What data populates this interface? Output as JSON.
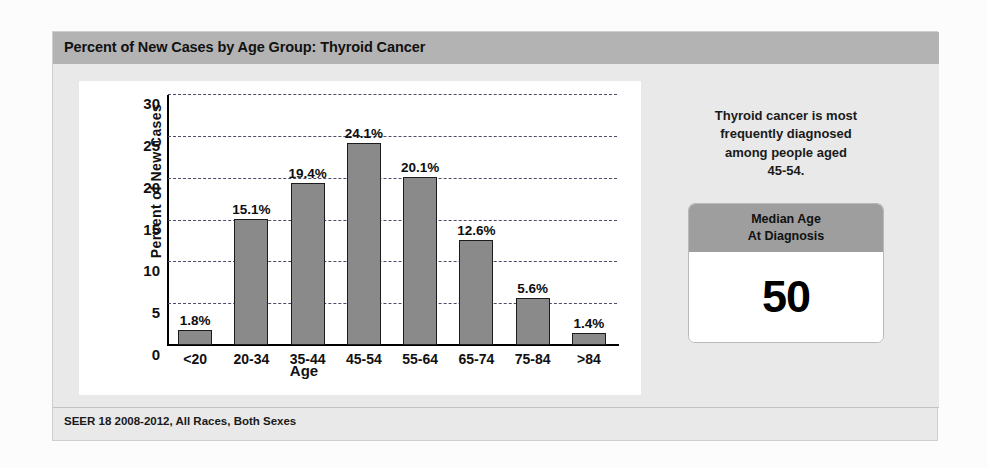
{
  "header": {
    "title": "Percent of New Cases by Age Group: Thyroid Cancer"
  },
  "footer": {
    "source": "SEER 18 2008-2012, All Races, Both Sexes"
  },
  "info_panel": {
    "blurb_line1": "Thyroid cancer is most",
    "blurb_line2": "frequently diagnosed",
    "blurb_line3": "among people aged",
    "blurb_line4": "45-54.",
    "median_box": {
      "header_line1": "Median Age",
      "header_line2": "At Diagnosis",
      "value": "50"
    }
  },
  "colors": {
    "title_bar": "#b3b3b3",
    "card_background": "#e9e9e9",
    "bar_fill": "#8a8a8a",
    "bar_stroke": "#1c1c1c",
    "gridline": "#4d4d6b",
    "median_header": "#9e9e9e"
  },
  "chart_data": {
    "type": "bar",
    "title": "Percent of New Cases by Age Group: Thyroid Cancer",
    "xlabel": "Age",
    "ylabel": "Percent of New Cases",
    "categories": [
      "<20",
      "20-34",
      "35-44",
      "45-54",
      "55-64",
      "65-74",
      "75-84",
      ">84"
    ],
    "values": [
      1.8,
      15.1,
      19.4,
      24.1,
      20.1,
      12.6,
      5.6,
      1.4
    ],
    "value_labels": [
      "1.8%",
      "15.1%",
      "19.4%",
      "24.1%",
      "20.1%",
      "12.6%",
      "5.6%",
      "1.4%"
    ],
    "ylim": [
      0,
      30
    ],
    "yticks": [
      0,
      5,
      10,
      15,
      20,
      25,
      30
    ],
    "ytick_labels": [
      "0",
      "5",
      "10",
      "15",
      "20",
      "25",
      "30"
    ],
    "grid": true,
    "grid_style": "dashed-horizontal",
    "legend": null,
    "source_note": "SEER 18 2008-2012, All Races, Both Sexes"
  }
}
